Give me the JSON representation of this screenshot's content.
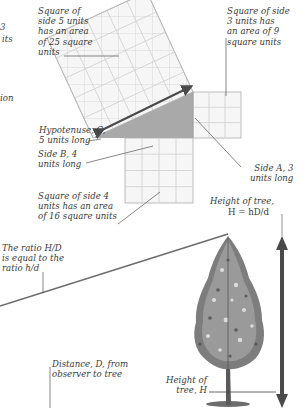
{
  "diagram": {
    "pythagoras": {
      "labels": {
        "cropped_left_top_1": "3",
        "cropped_left_top_2": "its",
        "cropped_left_mid": "ion",
        "square_c": "Square of\nside 5 units\nhas an area\nof 25 square\nunits",
        "square_a": "Square of side\n3 units has\nan area of 9\nsquare units",
        "hypotenuse": "Hypotenuse, C,\n5 units long",
        "side_b": "Side B, 4\nunits long",
        "side_a": "Side A, 3\nunits long",
        "square_b": "Square of side 4\nunits has an area\nof 16 square units"
      },
      "sides": {
        "A": 3,
        "B": 4,
        "C": 5
      },
      "areas": {
        "A2": 9,
        "B2": 16,
        "C2": 25
      }
    },
    "tree": {
      "labels": {
        "height_formula_1": "Height of tree,",
        "height_formula_2": "H = hD/d",
        "ratio": "The ratio H/D\nis equal to the\nratio h/d",
        "distance": "Distance, D, from\nobserver to tree",
        "height_of_tree": "Height of\ntree, H"
      }
    },
    "colors": {
      "grid_line": "#c9c9c9",
      "square_fill": "#f6f6f6",
      "triangle_fill": "#a9a9a9",
      "arrow": "#4a4a4a",
      "leader_line": "#555555",
      "sight_line": "#6b6b6b"
    }
  }
}
